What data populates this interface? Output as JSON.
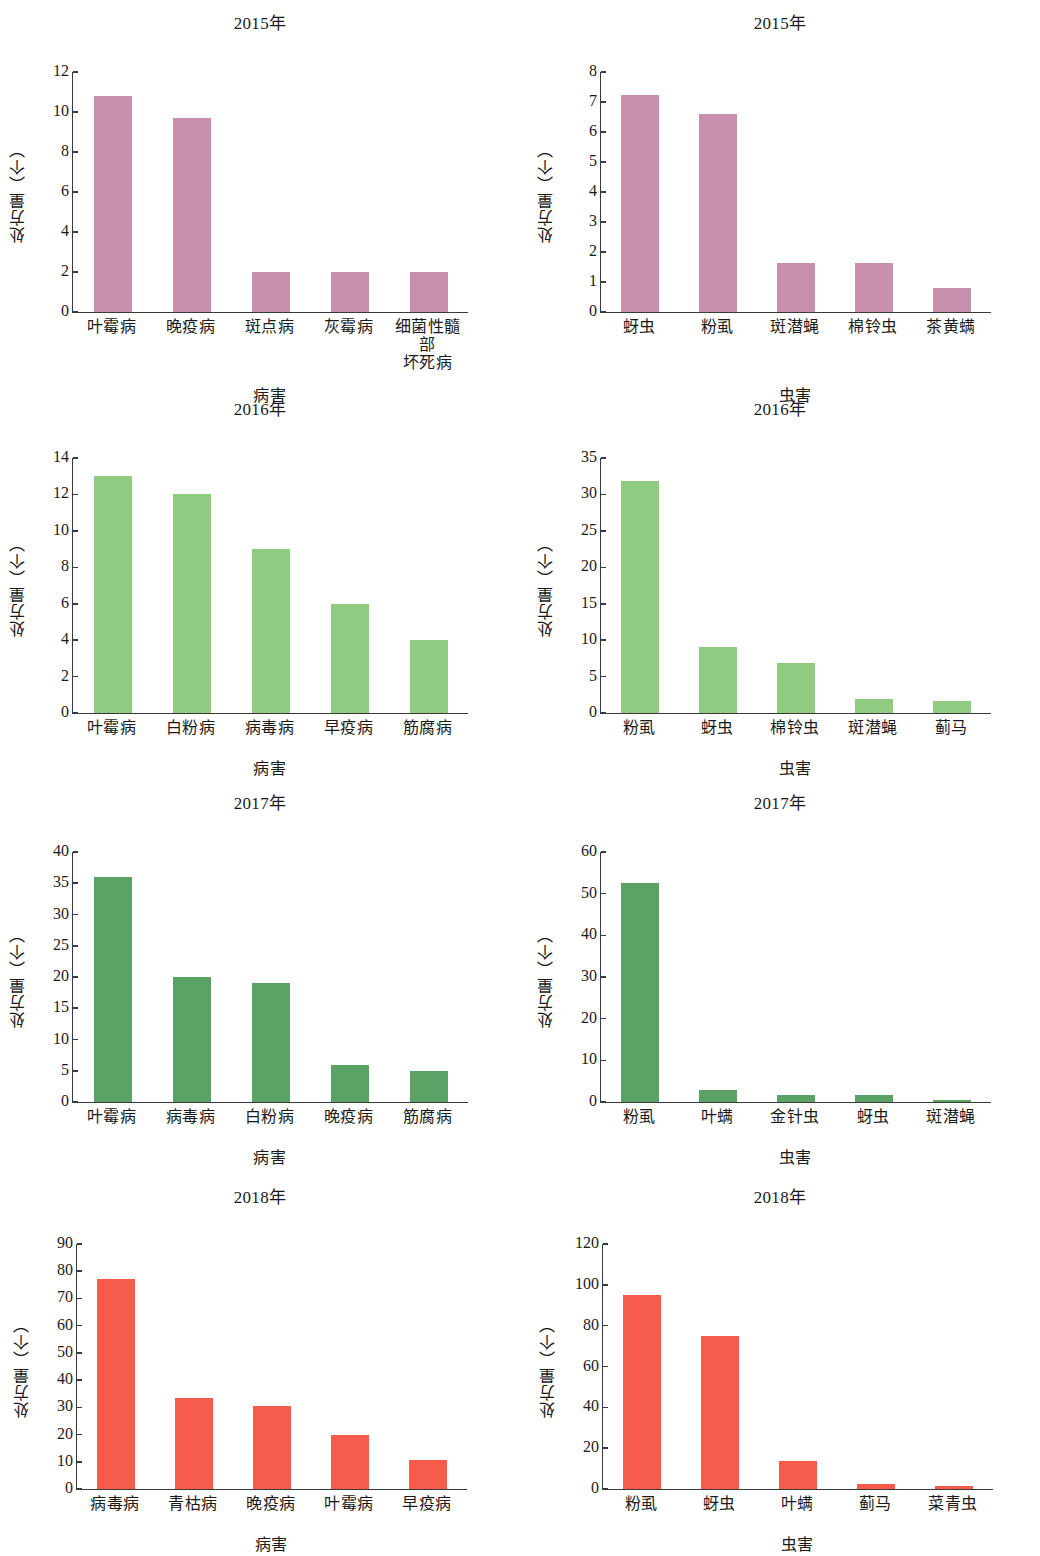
{
  "figure": {
    "y_axis_label": "处方量（个）",
    "disease_axis_label": "病害",
    "pest_axis_label": "虫害"
  },
  "chart_data": [
    {
      "id": "disease-2015",
      "type": "bar",
      "title": "2015年",
      "xlabel": "病害",
      "ylabel": "处方量（个）",
      "categories": [
        "叶霉病",
        "晚疫病",
        "斑点病",
        "灰霉病",
        "细菌性髓部\n坏死病"
      ],
      "values": [
        10.8,
        9.7,
        2.0,
        2.0,
        2.0
      ],
      "ticks": [
        0,
        2,
        4,
        6,
        8,
        10,
        12
      ],
      "ylim": [
        0,
        12
      ],
      "color": "#c890ac",
      "grid": false,
      "legend": "none"
    },
    {
      "id": "pest-2015",
      "type": "bar",
      "title": "2015年",
      "xlabel": "虫害",
      "ylabel": "处方量（个）",
      "categories": [
        "蚜虫",
        "粉虱",
        "斑潜蝇",
        "棉铃虫",
        "茶黄螨"
      ],
      "values": [
        7.25,
        6.6,
        1.65,
        1.65,
        0.8
      ],
      "ticks": [
        0,
        1,
        2,
        3,
        4,
        5,
        6,
        7,
        8
      ],
      "ylim": [
        0,
        8
      ],
      "color": "#c890ac",
      "grid": false,
      "legend": "none"
    },
    {
      "id": "disease-2016",
      "type": "bar",
      "title": "2016年",
      "xlabel": "病害",
      "ylabel": "处方量（个）",
      "categories": [
        "叶霉病",
        "白粉病",
        "病毒病",
        "早疫病",
        "筋腐病"
      ],
      "values": [
        13,
        12,
        9,
        6,
        4
      ],
      "ticks": [
        0,
        2,
        4,
        6,
        8,
        10,
        12,
        14
      ],
      "ylim": [
        0,
        14
      ],
      "color": "#8fcb80",
      "grid": false,
      "legend": "none"
    },
    {
      "id": "pest-2016",
      "type": "bar",
      "title": "2016年",
      "xlabel": "虫害",
      "ylabel": "处方量（个）",
      "categories": [
        "粉虱",
        "蚜虫",
        "棉铃虫",
        "斑潜蝇",
        "蓟马"
      ],
      "values": [
        31.8,
        9,
        6.8,
        1.9,
        1.6
      ],
      "ticks": [
        0,
        5,
        10,
        15,
        20,
        25,
        30,
        35
      ],
      "ylim": [
        0,
        35
      ],
      "color": "#8fcb80",
      "grid": false,
      "legend": "none"
    },
    {
      "id": "disease-2017",
      "type": "bar",
      "title": "2017年",
      "xlabel": "病害",
      "ylabel": "处方量（个）",
      "categories": [
        "叶霉病",
        "病毒病",
        "白粉病",
        "晚疫病",
        "筋腐病"
      ],
      "values": [
        36,
        20,
        19,
        6,
        5
      ],
      "ticks": [
        0,
        5,
        10,
        15,
        20,
        25,
        30,
        35,
        40
      ],
      "ylim": [
        0,
        40
      ],
      "color": "#5ba267",
      "grid": false,
      "legend": "none"
    },
    {
      "id": "pest-2017",
      "type": "bar",
      "title": "2017年",
      "xlabel": "虫害",
      "ylabel": "处方量（个）",
      "categories": [
        "粉虱",
        "叶螨",
        "金针虫",
        "蚜虫",
        "斑潜蝇"
      ],
      "values": [
        52.5,
        3.0,
        1.6,
        1.6,
        0.6
      ],
      "ticks": [
        0,
        10,
        20,
        30,
        40,
        50,
        60
      ],
      "ylim": [
        0,
        60
      ],
      "color": "#5ba267",
      "grid": false,
      "legend": "none"
    },
    {
      "id": "disease-2018",
      "type": "bar",
      "title": "2018年",
      "xlabel": "病害",
      "ylabel": "处方量（个）",
      "categories": [
        "病毒病",
        "青枯病",
        "晚疫病",
        "叶霉病",
        "早疫病"
      ],
      "values": [
        77,
        33.5,
        30.5,
        20,
        10.6
      ],
      "ticks": [
        0,
        10,
        20,
        30,
        40,
        50,
        60,
        70,
        80,
        90
      ],
      "ylim": [
        0,
        90
      ],
      "color": "#f75b4b",
      "grid": false,
      "legend": "none"
    },
    {
      "id": "pest-2018",
      "type": "bar",
      "title": "2018年",
      "xlabel": "虫害",
      "ylabel": "处方量（个）",
      "categories": [
        "粉虱",
        "蚜虫",
        "叶螨",
        "蓟马",
        "菜青虫"
      ],
      "values": [
        95,
        75,
        13.5,
        2.5,
        1.3
      ],
      "ticks": [
        0,
        20,
        40,
        60,
        80,
        100,
        120
      ],
      "ylim": [
        0,
        120
      ],
      "color": "#f75b4b",
      "grid": false,
      "legend": "none"
    }
  ]
}
